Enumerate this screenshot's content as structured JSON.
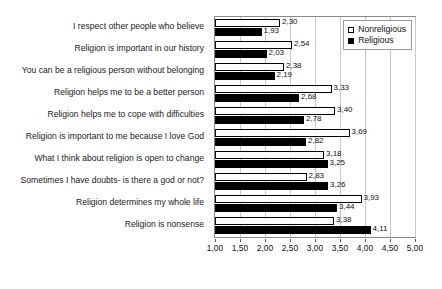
{
  "title": "",
  "legend": {
    "position": "top-right-inside",
    "entries": [
      {
        "label": "Nonreligious",
        "swatch": "hollow-square-icon",
        "color": "#ffffff"
      },
      {
        "label": "Religious",
        "swatch": "filled-square-icon",
        "color": "#000000"
      }
    ]
  },
  "axis": {
    "ticks": [
      "1,00",
      "1,50",
      "2,00",
      "2,50",
      "3,00",
      "3,50",
      "4,00",
      "4,50",
      "5,00"
    ]
  },
  "chart_data": {
    "type": "bar",
    "orientation": "horizontal",
    "title": "",
    "xlabel": "",
    "ylabel": "",
    "xlim": [
      1.0,
      5.0
    ],
    "xtick_step": 0.5,
    "grid": true,
    "decimal_separator": ",",
    "legend_position": "top-right-inside",
    "categories": [
      "I respect other people who believe",
      "Religion is important in our history",
      "You can be a religious person without belonging",
      "Religion helps me to be a better person",
      "Religion helps me to cope with difficulties",
      "Religion is important to me because I love God",
      "What I think about religion is open to change",
      "Sometimes I have doubts- is there a god or not?",
      "Religion determines my whole life",
      "Religion is nonsense"
    ],
    "series": [
      {
        "name": "Nonreligious",
        "color": "#ffffff",
        "values": [
          2.3,
          2.54,
          2.38,
          3.33,
          3.4,
          3.69,
          3.18,
          2.83,
          3.93,
          3.38
        ],
        "labels": [
          "2,30",
          "2,54",
          "2,38",
          "3,33",
          "3,40",
          "3,69",
          "3,18",
          "2,83",
          "3,93",
          "3,38"
        ]
      },
      {
        "name": "Religious",
        "color": "#000000",
        "values": [
          1.93,
          2.03,
          2.19,
          2.68,
          2.78,
          2.82,
          3.25,
          3.26,
          3.44,
          4.11
        ],
        "labels": [
          "1,93",
          "2,03",
          "2,19",
          "2,68",
          "2,78",
          "2,82",
          "3,25",
          "3,26",
          "3,44",
          "4,11"
        ]
      }
    ]
  }
}
